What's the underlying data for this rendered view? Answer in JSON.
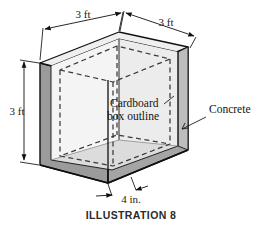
{
  "figure": {
    "caption": "ILLUSTRATION 8",
    "dimensions": [
      {
        "id": "top-left-width",
        "label": "3 ft"
      },
      {
        "id": "top-right-depth",
        "label": "3 ft"
      },
      {
        "id": "left-height",
        "label": "3 ft"
      },
      {
        "id": "wall-thickness",
        "label": "4 in."
      }
    ],
    "annotations": [
      {
        "id": "cardboard",
        "line1": "Cardboard",
        "line2": "box outline"
      },
      {
        "id": "concrete",
        "label": "Concrete"
      }
    ],
    "colors": {
      "outline": "#111111",
      "wall_exterior": "#9b9b9b",
      "wall_exterior_right": "#a5a5a5",
      "interior_back": "#f2f2f2",
      "interior_side": "#d8d8d8",
      "floor": "#dcdcdc",
      "rim_top": "#efefef",
      "dashed": "#3a3a3a",
      "background": "#ffffff",
      "text": "#141414"
    },
    "shape": {
      "type": "isometric-open-box",
      "wall_thickness_in": 4,
      "side_ft": 3
    }
  }
}
